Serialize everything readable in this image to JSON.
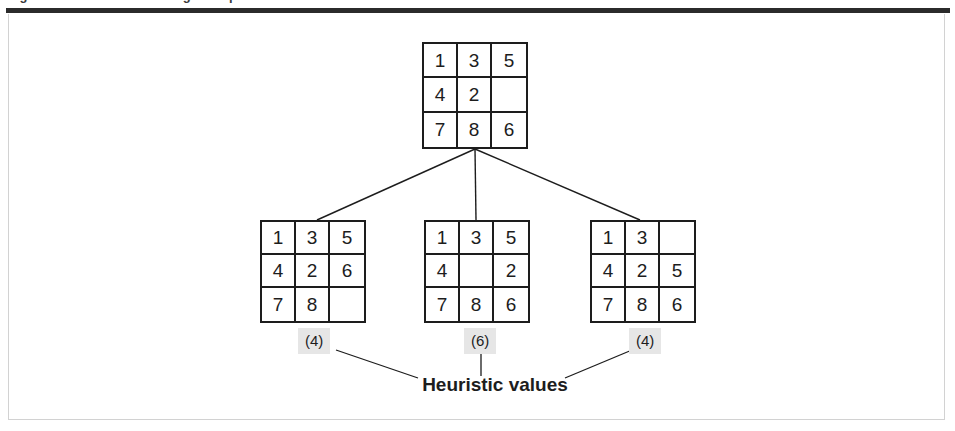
{
  "figure": {
    "caption": "Figure  Heuristic search using the 8-puzzle",
    "leader_label": "Heuristic values",
    "rule_color": "#2b2b2b",
    "frame_color": "#d2d2d2",
    "grid_line_color": "#1d1d1d",
    "badge_background": "#e6e6e6",
    "text_color": "#1d1d1d"
  },
  "tree": {
    "root": {
      "name": "root-state",
      "tiles": [
        "1",
        "3",
        "5",
        "4",
        "2",
        "",
        "7",
        "8",
        "6"
      ]
    },
    "children": [
      {
        "name": "child-state-left",
        "tiles": [
          "1",
          "3",
          "5",
          "4",
          "2",
          "6",
          "7",
          "8",
          ""
        ],
        "heuristic": "(4)"
      },
      {
        "name": "child-state-middle",
        "tiles": [
          "1",
          "3",
          "5",
          "4",
          "",
          "2",
          "7",
          "8",
          "6"
        ],
        "heuristic": "(6)"
      },
      {
        "name": "child-state-right",
        "tiles": [
          "1",
          "3",
          "",
          "4",
          "2",
          "5",
          "7",
          "8",
          "6"
        ],
        "heuristic": "(4)"
      }
    ]
  }
}
